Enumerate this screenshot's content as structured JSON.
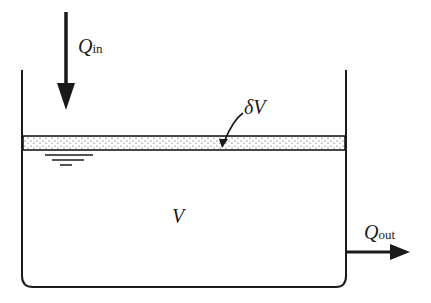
{
  "diagram": {
    "inflow": {
      "symbol": "Q",
      "subscript": "in"
    },
    "outflow": {
      "symbol": "Q",
      "subscript": "out"
    },
    "layer": {
      "label": "δV"
    },
    "volume": {
      "label": "V"
    },
    "colors": {
      "ink": "#1a1a1a",
      "background": "#ffffff"
    }
  }
}
